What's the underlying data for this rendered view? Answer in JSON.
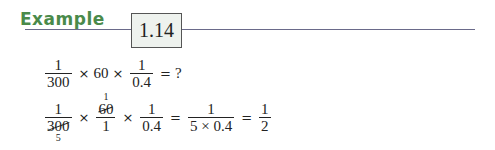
{
  "header": {
    "label": "Example",
    "number": "1.14"
  },
  "line1": {
    "frac1": {
      "num": "1",
      "den": "300"
    },
    "op1": "×",
    "term": "60",
    "op2": "×",
    "frac2": {
      "num": "1",
      "den": "0.4"
    },
    "eq": "=",
    "result": "?"
  },
  "line2": {
    "frac1": {
      "num": "1",
      "den": "300",
      "den_cancel": "5"
    },
    "op1": "×",
    "frac2": {
      "num": "60",
      "num_cancel": "1",
      "den": "1"
    },
    "op2": "×",
    "frac3": {
      "num": "1",
      "den": "0.4"
    },
    "eq1": "=",
    "frac4": {
      "num": "1",
      "den": "5 × 0.4"
    },
    "eq2": "=",
    "frac5": {
      "num": "1",
      "den": "2"
    }
  },
  "colors": {
    "title": "#4a8a4a",
    "rule": "#6a6a8a",
    "box_bg": "#eef2ee"
  }
}
